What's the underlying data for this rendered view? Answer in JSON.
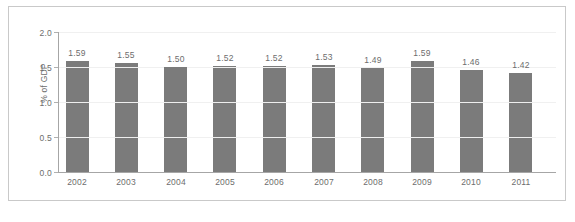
{
  "chart_data": {
    "type": "bar",
    "title": "",
    "subtitle": "",
    "xlabel": "",
    "ylabel": "% of GDP",
    "categories": [
      "2002",
      "2003",
      "2004",
      "2005",
      "2006",
      "2007",
      "2008",
      "2009",
      "2010",
      "2011"
    ],
    "values": [
      1.59,
      1.55,
      1.5,
      1.52,
      1.52,
      1.53,
      1.49,
      1.59,
      1.46,
      1.42
    ],
    "data_labels": [
      "1.59",
      "1.55",
      "1.50",
      "1.52",
      "1.52",
      "1.53",
      "1.49",
      "1.59",
      "1.46",
      "1.42"
    ],
    "ylim": [
      0.0,
      2.0
    ],
    "ytick_labels": [
      "2.0",
      "1.5",
      "1.0",
      "0.5",
      "0.0"
    ],
    "ytick_values": [
      2.0,
      1.5,
      1.0,
      0.5,
      0.0
    ],
    "grid": true,
    "legend": "none",
    "bar_color": "#7b7b7b",
    "gridline_color": "#f0f0f0",
    "axis_color": "#a6a6a6",
    "text_color": "#6d6d6d",
    "border_color": "#c9c9c9",
    "background_color": "#ffffff"
  }
}
